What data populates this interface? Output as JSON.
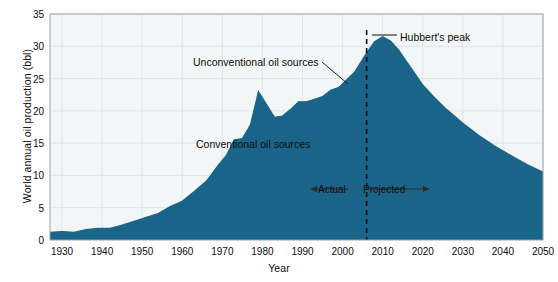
{
  "chart_data": {
    "type": "area",
    "title": "",
    "xlabel": "Year",
    "ylabel": "World annual oil production (bbl)",
    "xlim": [
      1927,
      2050
    ],
    "ylim": [
      0,
      35
    ],
    "grid": true,
    "legend_position": "inline-annotations",
    "x_ticks": [
      1930,
      1940,
      1950,
      1960,
      1970,
      1980,
      1990,
      2000,
      2010,
      2020,
      2030,
      2040,
      2050
    ],
    "y_ticks": [
      0,
      5,
      10,
      15,
      20,
      25,
      30,
      35
    ],
    "stacked": true,
    "x": [
      1927,
      1930,
      1933,
      1936,
      1939,
      1942,
      1945,
      1948,
      1951,
      1954,
      1957,
      1960,
      1963,
      1966,
      1969,
      1971,
      1973,
      1975,
      1977,
      1979,
      1981,
      1983,
      1985,
      1987,
      1989,
      1991,
      1993,
      1995,
      1997,
      1999,
      2001,
      2003,
      2005,
      2006,
      2008,
      2010,
      2012,
      2014,
      2016,
      2018,
      2020,
      2023,
      2026,
      2030,
      2034,
      2038,
      2042,
      2046,
      2050
    ],
    "series": [
      {
        "name": "Conventional oil sources",
        "color": "#a6b3c1",
        "values": [
          1.0,
          1.1,
          1.0,
          1.4,
          1.6,
          1.6,
          2.0,
          2.6,
          3.2,
          3.8,
          4.8,
          5.6,
          7.0,
          8.6,
          11.0,
          12.4,
          14.6,
          14.6,
          16.4,
          17.0,
          15.8,
          14.2,
          14.6,
          15.8,
          16.8,
          17.0,
          17.2,
          18.0,
          19.2,
          19.4,
          20.2,
          20.8,
          21.6,
          21.8,
          22.3,
          22.5,
          22.2,
          21.4,
          20.4,
          19.4,
          18.2,
          16.6,
          15.2,
          13.4,
          11.8,
          10.4,
          9.3,
          8.3,
          7.4
        ]
      },
      {
        "name": "Unconventional oil sources",
        "color": "#1b6489",
        "values": [
          0.2,
          0.2,
          0.2,
          0.2,
          0.2,
          0.2,
          0.3,
          0.3,
          0.3,
          0.3,
          0.4,
          0.4,
          0.5,
          0.5,
          0.6,
          0.7,
          0.9,
          1.1,
          1.4,
          6.0,
          5.2,
          4.8,
          4.6,
          4.4,
          4.6,
          4.4,
          4.6,
          4.2,
          4.0,
          4.2,
          4.6,
          5.2,
          6.4,
          7.2,
          8.4,
          9.0,
          8.6,
          8.0,
          7.2,
          6.4,
          5.8,
          5.4,
          5.0,
          4.7,
          4.4,
          4.1,
          3.8,
          3.4,
          3.1
        ]
      }
    ],
    "annotations": [
      {
        "id": "unconventional",
        "text": "Unconventional oil sources",
        "x": 1983,
        "y": 27.5
      },
      {
        "id": "conventional",
        "text": "Conventional oil sources",
        "x": 1984,
        "y": 14.5
      },
      {
        "id": "hubbert",
        "text": "Hubbert's peak",
        "x": 2022,
        "y": 31.5
      },
      {
        "id": "actual",
        "text": "Actual",
        "x": 1998,
        "y": 8.5
      },
      {
        "id": "projected",
        "text": "Projected",
        "x": 2014,
        "y": 8.5
      }
    ],
    "divider": {
      "label": "Actual / Projected boundary",
      "x": 2006,
      "style": "dashed"
    },
    "peak": {
      "label": "Hubbert's peak",
      "x": 2010,
      "y": 31.5
    }
  },
  "colors": {
    "conventional": "#a6b3c1",
    "unconventional": "#1b6489",
    "plot_background": "#f3f6f7",
    "grid": "#dfe5e8",
    "axis": "#9aa3a8",
    "text": "#0d0d0d"
  },
  "axes": {
    "y_title": "World annual oil production (bbl)",
    "x_title": "Year",
    "y_labels": [
      "0",
      "5",
      "10",
      "15",
      "20",
      "25",
      "30",
      "35"
    ],
    "x_labels": [
      "1930",
      "1940",
      "1950",
      "1960",
      "1970",
      "1980",
      "1990",
      "2000",
      "2010",
      "2020",
      "2030",
      "2040",
      "2050"
    ]
  },
  "annotations": {
    "unconventional": "Unconventional oil sources",
    "conventional": "Conventional oil sources",
    "hubbert": "Hubbert's peak",
    "actual": "Actual",
    "projected": "Projected"
  }
}
